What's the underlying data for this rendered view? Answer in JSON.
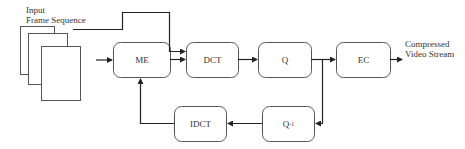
{
  "diagram": {
    "input_label_line1": "Input",
    "input_label_line2": "Frame Sequence",
    "output_label_line1": "Compressed",
    "output_label_line2": "Video Stream",
    "blocks": {
      "me": "ME",
      "dct": "DCT",
      "q": "Q",
      "ec": "EC",
      "idct": "IDCT",
      "q_inv": "Q",
      "q_inv_sup": "-1"
    },
    "colors": {
      "stroke": "#444444",
      "background": "#ffffff"
    }
  }
}
